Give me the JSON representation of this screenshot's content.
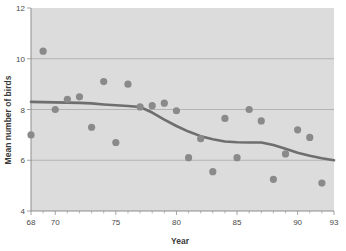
{
  "chart_data": {
    "type": "scatter",
    "title": "",
    "subtitle": "",
    "xlabel": "Year",
    "ylabel": "Mean number of birds",
    "xlim": [
      68,
      93
    ],
    "ylim": [
      4,
      12
    ],
    "xticks": [
      68,
      70,
      75,
      80,
      85,
      90,
      93
    ],
    "xtick_labels": [
      "68",
      "70",
      "75",
      "80",
      "85",
      "90",
      "93"
    ],
    "yticks": [
      4,
      6,
      8,
      10,
      12
    ],
    "ytick_labels": [
      "4",
      "6",
      "8",
      "10",
      "12"
    ],
    "grid": true,
    "grid_axis": "y",
    "legend": false,
    "legend_position": "none",
    "point_color": "#8a8a8a",
    "trend_color": "#6e6e6e",
    "plot_background": "#dcdcdc",
    "series": [
      {
        "name": "Mean number of birds",
        "type": "scatter",
        "x": [
          68,
          69,
          70,
          71,
          72,
          73,
          74,
          75,
          76,
          77,
          78,
          79,
          80,
          81,
          82,
          83,
          84,
          85,
          86,
          87,
          88,
          89,
          90,
          91,
          92
        ],
        "y": [
          7.0,
          10.3,
          8.0,
          8.4,
          8.5,
          7.3,
          9.1,
          6.7,
          9.0,
          8.1,
          8.15,
          8.25,
          7.95,
          6.1,
          6.85,
          5.55,
          7.65,
          6.1,
          8.0,
          7.55,
          5.25,
          6.25,
          7.2,
          6.9,
          5.1
        ]
      },
      {
        "name": "Smoothed trend",
        "type": "line",
        "x": [
          68,
          70,
          71,
          72,
          73,
          74,
          75,
          76,
          77,
          78,
          79,
          80,
          81,
          82,
          83,
          84,
          85,
          86,
          87,
          88,
          89,
          90,
          91,
          92,
          93
        ],
        "y": [
          8.3,
          8.28,
          8.27,
          8.26,
          8.24,
          8.2,
          8.17,
          8.14,
          8.1,
          7.88,
          7.6,
          7.35,
          7.13,
          6.95,
          6.83,
          6.74,
          6.71,
          6.7,
          6.7,
          6.6,
          6.45,
          6.3,
          6.18,
          6.08,
          6.0
        ]
      }
    ]
  }
}
